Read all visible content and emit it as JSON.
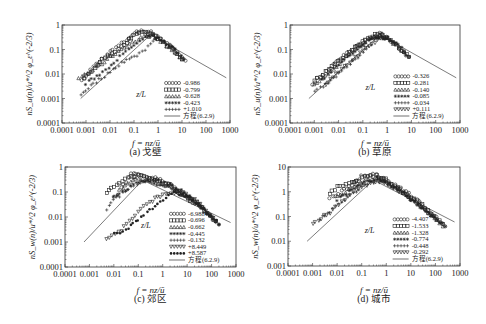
{
  "figure": {
    "equation_label": "方程(6.2.9)",
    "legend_heading": "z/L"
  },
  "chart_data": [
    {
      "id": "a",
      "type": "scatter",
      "caption": "(a) 戈壁",
      "title": "",
      "xlabel": "f = nz/ū",
      "ylabel": "nS_u(n)/u*^2 φ_ε^(-2/3)",
      "xscale": "log",
      "yscale": "log",
      "xlim": [
        0.0001,
        1000
      ],
      "ylim": [
        0.0001,
        1
      ],
      "x_ticks": [
        "0.0001",
        "0.001",
        "0.01",
        "0.1",
        "1",
        "10",
        "100",
        "1000"
      ],
      "y_ticks": [
        "0.0001",
        "0.001",
        "0.01",
        "0.1",
        "1"
      ],
      "grid": false,
      "legend_position": "lower right",
      "legend_heading": "z/L",
      "series": [
        {
          "name": "-0.986",
          "marker": "circle",
          "x": [
            0.0007,
            0.002,
            0.01,
            0.05,
            0.1,
            0.2,
            0.4,
            1,
            3,
            10,
            14
          ],
          "y": [
            0.005,
            0.02,
            0.08,
            0.25,
            0.45,
            0.6,
            0.55,
            0.35,
            0.15,
            0.05,
            0.035
          ]
        },
        {
          "name": "-0.799",
          "marker": "square",
          "x": [
            0.0008,
            0.003,
            0.01,
            0.05,
            0.1,
            0.3,
            0.5,
            1,
            3,
            10
          ],
          "y": [
            0.006,
            0.025,
            0.06,
            0.2,
            0.35,
            0.5,
            0.45,
            0.3,
            0.12,
            0.04
          ]
        },
        {
          "name": "-0.628",
          "marker": "triangle",
          "x": [
            0.0005,
            0.002,
            0.01,
            0.05,
            0.2,
            0.5,
            1,
            3,
            10
          ],
          "y": [
            0.007,
            0.015,
            0.05,
            0.15,
            0.3,
            0.4,
            0.3,
            0.12,
            0.04
          ]
        },
        {
          "name": "-0.423",
          "marker": "star",
          "x": [
            0.001,
            0.005,
            0.02,
            0.1,
            0.3,
            0.6,
            1,
            5,
            12
          ],
          "y": [
            0.004,
            0.012,
            0.04,
            0.15,
            0.3,
            0.35,
            0.28,
            0.1,
            0.04
          ]
        },
        {
          "name": "+1.010",
          "marker": "plus",
          "x": [
            0.0006,
            0.002,
            0.008,
            0.03,
            0.1,
            0.3,
            0.6,
            1,
            5
          ],
          "y": [
            0.0015,
            0.004,
            0.01,
            0.03,
            0.05,
            0.1,
            0.25,
            0.3,
            0.1
          ]
        }
      ],
      "reference_line": {
        "name": "方程(6.2.9)",
        "x": [
          0.0006,
          0.5,
          700
        ],
        "y": [
          0.001,
          0.4,
          0.007
        ]
      }
    },
    {
      "id": "b",
      "type": "scatter",
      "caption": "(b) 草原",
      "title": "",
      "xlabel": "f = nz/ū",
      "ylabel": "nS_u(n)/u*^2 φ_ε^(-2/3)",
      "xscale": "log",
      "yscale": "log",
      "xlim": [
        0.0001,
        1000
      ],
      "ylim": [
        0.0001,
        1
      ],
      "x_ticks": [
        "0.0001",
        "0.001",
        "0.01",
        "0.1",
        "1",
        "10",
        "100",
        "1000"
      ],
      "y_ticks": [
        "0.0001",
        "0.001",
        "0.01",
        "0.1",
        "1"
      ],
      "grid": false,
      "legend_position": "lower right",
      "legend_heading": "z/L",
      "series": [
        {
          "name": "-0.326",
          "marker": "circle",
          "x": [
            0.0008,
            0.003,
            0.01,
            0.05,
            0.1,
            0.3,
            0.5,
            1,
            3,
            8
          ],
          "y": [
            0.004,
            0.012,
            0.04,
            0.12,
            0.2,
            0.35,
            0.5,
            0.3,
            0.12,
            0.05
          ]
        },
        {
          "name": "-0.281",
          "marker": "square",
          "x": [
            0.001,
            0.004,
            0.02,
            0.06,
            0.2,
            0.4,
            1,
            4,
            8
          ],
          "y": [
            0.005,
            0.015,
            0.06,
            0.15,
            0.3,
            0.45,
            0.3,
            0.1,
            0.05
          ]
        },
        {
          "name": "-0.140",
          "marker": "triangle",
          "x": [
            0.001,
            0.005,
            0.02,
            0.1,
            0.3,
            0.6,
            1,
            5
          ],
          "y": [
            0.004,
            0.012,
            0.05,
            0.18,
            0.35,
            0.4,
            0.3,
            0.08
          ]
        },
        {
          "name": "-0.085",
          "marker": "star",
          "x": [
            0.002,
            0.008,
            0.03,
            0.1,
            0.3,
            1,
            3,
            8
          ],
          "y": [
            0.006,
            0.02,
            0.06,
            0.15,
            0.3,
            0.3,
            0.15,
            0.05
          ]
        },
        {
          "name": "-0.034",
          "marker": "plus",
          "x": [
            0.001,
            0.003,
            0.01,
            0.03,
            0.1,
            0.4,
            1,
            3
          ],
          "y": [
            0.002,
            0.004,
            0.01,
            0.025,
            0.08,
            0.3,
            0.3,
            0.12
          ]
        },
        {
          "name": "+0.111",
          "marker": "tri-down",
          "x": [
            0.003,
            0.01,
            0.03,
            0.1,
            0.4,
            1
          ],
          "y": [
            0.004,
            0.012,
            0.03,
            0.08,
            0.25,
            0.3
          ]
        }
      ],
      "reference_line": {
        "name": "方程(6.2.9)",
        "x": [
          0.0006,
          0.5,
          700
        ],
        "y": [
          0.001,
          0.4,
          0.007
        ]
      }
    },
    {
      "id": "c",
      "type": "scatter",
      "caption": "(c) 郊区",
      "title": "",
      "xlabel": "f = nz/ū",
      "ylabel": "nS_w(n)/u*^2 φ_ε^(-2/3)",
      "xscale": "log",
      "yscale": "log",
      "xlim": [
        0.0001,
        1000
      ],
      "ylim": [
        0.0001,
        1
      ],
      "x_ticks": [
        "0.0001",
        "0.001",
        "0.01",
        "0.1",
        "1",
        "10",
        "100",
        "1000"
      ],
      "y_ticks": [
        "0.0001",
        "0.001",
        "0.01",
        "0.1",
        "1"
      ],
      "grid": false,
      "legend_position": "lower right",
      "legend_heading": "z/L",
      "series": [
        {
          "name": "-6.988",
          "marker": "circle",
          "x": [
            0.02,
            0.05,
            0.1,
            0.3,
            1,
            3,
            10,
            50,
            200
          ],
          "y": [
            0.15,
            0.5,
            0.5,
            0.4,
            0.3,
            0.15,
            0.07,
            0.02,
            0.005
          ]
        },
        {
          "name": "-0.696",
          "marker": "square",
          "x": [
            0.005,
            0.01,
            0.03,
            0.1,
            0.3,
            1,
            5,
            30,
            150
          ],
          "y": [
            0.1,
            0.15,
            0.35,
            0.45,
            0.35,
            0.25,
            0.1,
            0.03,
            0.007
          ]
        },
        {
          "name": "-0.662",
          "marker": "triangle",
          "x": [
            0.01,
            0.03,
            0.1,
            0.3,
            1,
            5,
            30,
            150
          ],
          "y": [
            0.07,
            0.2,
            0.35,
            0.3,
            0.2,
            0.1,
            0.03,
            0.007
          ]
        },
        {
          "name": "-0.445",
          "marker": "star",
          "x": [
            0.01,
            0.03,
            0.1,
            0.5,
            2,
            10,
            50,
            200
          ],
          "y": [
            0.06,
            0.12,
            0.25,
            0.3,
            0.2,
            0.08,
            0.02,
            0.005
          ]
        },
        {
          "name": "-0.132",
          "marker": "plus",
          "x": [
            0.005,
            0.01,
            0.05,
            0.2,
            1,
            5,
            30,
            150
          ],
          "y": [
            0.02,
            0.05,
            0.15,
            0.25,
            0.2,
            0.1,
            0.03,
            0.006
          ]
        },
        {
          "name": "+8.449",
          "marker": "tri-down",
          "x": [
            0.005,
            0.02,
            0.1,
            0.3,
            1,
            5,
            20,
            100
          ],
          "y": [
            0.0013,
            0.003,
            0.015,
            0.04,
            0.08,
            0.1,
            0.05,
            0.01
          ]
        },
        {
          "name": "+8.587",
          "marker": "filled-circle",
          "x": [
            0.01,
            0.03,
            0.1,
            0.3,
            1,
            3,
            10,
            50,
            200
          ],
          "y": [
            0.002,
            0.003,
            0.008,
            0.02,
            0.05,
            0.09,
            0.07,
            0.02,
            0.005
          ]
        }
      ],
      "reference_line": {
        "name": "方程(6.2.9)",
        "x": [
          0.0006,
          0.15,
          600
        ],
        "y": [
          0.001,
          0.3,
          0.006
        ]
      }
    },
    {
      "id": "d",
      "type": "scatter",
      "caption": "(d) 城市",
      "title": "",
      "xlabel": "f = nz/ū",
      "ylabel": "nS_w(n)/u*^2 φ_ε^(-2/3)",
      "xscale": "log",
      "yscale": "log",
      "xlim": [
        0.0001,
        1000
      ],
      "ylim": [
        0.001,
        10
      ],
      "x_ticks": [
        "0.0001",
        "0.001",
        "0.01",
        "0.1",
        "1",
        "10",
        "100",
        "1000"
      ],
      "y_ticks": [
        "0.001",
        "0.01",
        "0.1",
        "1",
        "10"
      ],
      "grid": false,
      "legend_position": "lower right",
      "legend_heading": "z/L",
      "series": [
        {
          "name": "-4.407",
          "marker": "circle",
          "x": [
            0.005,
            0.02,
            0.05,
            0.1,
            0.3,
            1,
            5,
            30,
            250
          ],
          "y": [
            0.5,
            1.2,
            2.5,
            4,
            5,
            3,
            1.2,
            0.3,
            0.04
          ]
        },
        {
          "name": "-1.533",
          "marker": "square",
          "x": [
            0.005,
            0.01,
            0.03,
            0.1,
            0.3,
            1,
            5,
            30,
            200
          ],
          "y": [
            0.8,
            1.5,
            2,
            3.5,
            4.5,
            3,
            1,
            0.3,
            0.05
          ]
        },
        {
          "name": "-1.328",
          "marker": "triangle",
          "x": [
            0.01,
            0.03,
            0.1,
            0.3,
            1,
            5,
            30,
            200
          ],
          "y": [
            0.6,
            1.2,
            2.5,
            3.5,
            2.5,
            1,
            0.25,
            0.04
          ]
        },
        {
          "name": "-0.774",
          "marker": "star",
          "x": [
            0.01,
            0.03,
            0.1,
            0.4,
            1,
            5,
            30,
            250
          ],
          "y": [
            0.5,
            1,
            2,
            3.5,
            2.5,
            0.9,
            0.2,
            0.04
          ]
        },
        {
          "name": "-0.448",
          "marker": "plus",
          "x": [
            0.002,
            0.005,
            0.02,
            0.1,
            0.4,
            2,
            20,
            150
          ],
          "y": [
            0.08,
            0.15,
            0.5,
            1.5,
            3,
            1.5,
            0.3,
            0.06
          ]
        },
        {
          "name": "-0.292",
          "marker": "tri-down",
          "x": [
            0.001,
            0.005,
            0.02,
            0.1,
            0.5,
            2,
            10,
            100
          ],
          "y": [
            0.05,
            0.15,
            0.5,
            1.5,
            2.5,
            1.5,
            0.5,
            0.08
          ]
        }
      ],
      "reference_line": {
        "name": "方程(6.2.9)",
        "x": [
          0.0006,
          0.3,
          600
        ],
        "y": [
          0.01,
          3,
          0.06
        ]
      }
    }
  ]
}
